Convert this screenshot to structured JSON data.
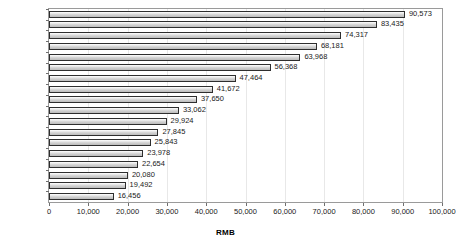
{
  "chart_data": {
    "type": "bar",
    "orientation": "horizontal",
    "title": "",
    "xlabel": "RMB",
    "ylabel": "",
    "xlim": [
      0,
      100000
    ],
    "xticks": [
      0,
      10000,
      20000,
      30000,
      40000,
      50000,
      60000,
      70000,
      80000,
      90000,
      100000
    ],
    "xtick_labels": [
      "0",
      "10,000",
      "20,000",
      "30,000",
      "40,000",
      "50,000",
      "60,000",
      "70,000",
      "80,000",
      "90,000",
      "100,000"
    ],
    "grid": "vertical-light",
    "legend": "none",
    "data_labels": true,
    "categories": [
      "2016",
      "2015",
      "2014",
      "2013",
      "2012",
      "2011",
      "2010",
      "2009",
      "2008",
      "2007",
      "2006",
      "2005",
      "2004",
      "2003",
      "2002",
      "2001",
      "2000",
      "1999"
    ],
    "values": [
      90573,
      83435,
      74317,
      68181,
      63968,
      56368,
      47464,
      41672,
      37650,
      33062,
      29924,
      27845,
      25843,
      23978,
      22654,
      20080,
      19492,
      16456
    ],
    "value_labels": [
      "90,573",
      "83,435",
      "74,317",
      "68,181",
      "63,968",
      "56,368",
      "47,464",
      "41,672",
      "37,650",
      "33,062",
      "29,924",
      "27,845",
      "25,843",
      "23,978",
      "22,654",
      "20,080",
      "19,492",
      "16,456"
    ],
    "colors": {
      "bar_fill": "#d2d2d2",
      "bar_border": "#2e2e2e",
      "plot_border": "#9a9a9a",
      "gridline": "#e8e8e8",
      "text": "#1a1a1a",
      "background": "#ffffff"
    }
  }
}
